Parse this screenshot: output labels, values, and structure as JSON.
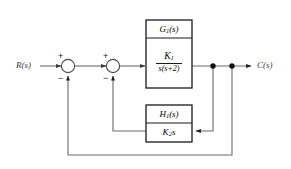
{
  "diagram": {
    "type": "control-system-block-diagram",
    "background_color": "#ffffff",
    "line_color": "#555555",
    "box_border_color": "#1a1a1a",
    "text_color": "#1a1a1a",
    "input": {
      "label": "R(s)",
      "name": "reference-input"
    },
    "output": {
      "label": "C(s)",
      "name": "controlled-output"
    },
    "summing_junctions": [
      {
        "name": "outer-summing-junction",
        "input_sign": "+",
        "feedback_sign": "−"
      },
      {
        "name": "inner-summing-junction",
        "input_sign": "+",
        "feedback_sign": "−"
      }
    ],
    "blocks": [
      {
        "name": "forward-path-block",
        "title": "G₁(s)",
        "title_main": "G",
        "title_sub": "1",
        "title_tail": "(s)",
        "numerator": "K₁",
        "numerator_main": "K",
        "numerator_sub": "1",
        "denominator": "s(s+2)"
      },
      {
        "name": "rate-feedback-block",
        "title": "H₁(s)",
        "title_main": "H",
        "title_sub": "1",
        "title_tail": "(s)",
        "expression": "K₂s",
        "expression_main": "K",
        "expression_sub": "2",
        "expression_tail": "s"
      }
    ],
    "takeoff_points": [
      {
        "name": "inner-loop-takeoff"
      },
      {
        "name": "outer-loop-takeoff"
      }
    ]
  }
}
